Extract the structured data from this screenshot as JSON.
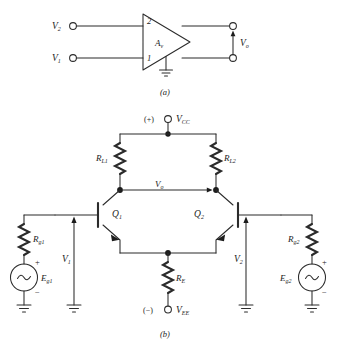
{
  "figure": {
    "background": "#ffffff",
    "ink": "#2b2b2b",
    "panel_a": {
      "caption": "(a)",
      "amp_label": "A",
      "amp_label_sub": "v",
      "pin_top": "2",
      "pin_bottom": "1",
      "input_top": "V",
      "input_top_sub": "2",
      "input_bottom": "V",
      "input_bottom_sub": "1",
      "output": "V",
      "output_sub": "o",
      "ground_icon": "ground-icon"
    },
    "panel_b": {
      "caption": "(b)",
      "supply_pos_sign": "(+)",
      "supply_pos": "V",
      "supply_pos_sub": "CC",
      "supply_neg_sign": "(−)",
      "supply_neg": "V",
      "supply_neg_sub": "EE",
      "load_left": "R",
      "load_left_sub": "L1",
      "load_right": "R",
      "load_right_sub": "L2",
      "emitter_res": "R",
      "emitter_res_sub": "E",
      "out_label": "V",
      "out_label_sub": "o",
      "transistor_left": "Q",
      "transistor_left_sub": "1",
      "transistor_right": "Q",
      "transistor_right_sub": "2",
      "gen_res_left": "R",
      "gen_res_left_sub": "g1",
      "gen_res_right": "R",
      "gen_res_right_sub": "g2",
      "source_left": "E",
      "source_left_sub": "g1",
      "source_right": "E",
      "source_right_sub": "g2",
      "source_glyph": "sine-wave-icon",
      "plus": "+",
      "minus": "−",
      "input_left": "V",
      "input_left_sub": "1",
      "input_right": "V",
      "input_right_sub": "2",
      "ground_icon": "ground-icon"
    }
  }
}
